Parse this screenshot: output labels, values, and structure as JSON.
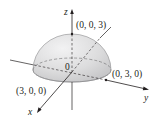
{
  "diagram": {
    "title": "",
    "shape": "upper hemisphere of radius 3",
    "radius": 3,
    "axes": {
      "x_label": "x",
      "y_label": "y",
      "z_label": "z"
    },
    "origin_label": "0",
    "points": [
      {
        "id": "top",
        "label": "(0, 0, 3)"
      },
      {
        "id": "y-intercept",
        "label": "(0, 3, 0)"
      },
      {
        "id": "x-intercept",
        "label": "(3, 0, 0)"
      }
    ],
    "colors": {
      "surface_fill": "#d9d9da",
      "surface_highlight": "#eeeeef",
      "line": "#231f20"
    }
  }
}
